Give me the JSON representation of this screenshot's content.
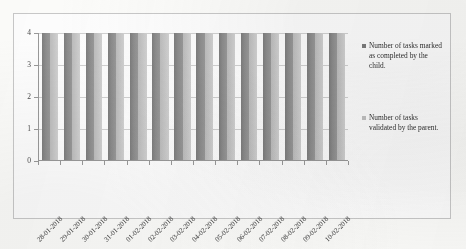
{
  "chart_data": {
    "type": "bar",
    "title": "",
    "subtitle": "",
    "xlabel": "",
    "ylabel": "",
    "ylim": [
      0,
      4
    ],
    "yticks": [
      "0",
      "1",
      "2",
      "3",
      "4"
    ],
    "grid": true,
    "legend_position": "right",
    "grouping": "grouped",
    "categories": [
      "28-01-2018",
      "29-01-2018",
      "30-01-2018",
      "31-01-2018",
      "01-02-2018",
      "02-02-2018",
      "03-02-2018",
      "04-02-2018",
      "05-02-2018",
      "06-02-2018",
      "07-02-2018",
      "08-02-2018",
      "09-02-2018",
      "10-02-2018"
    ],
    "series": [
      {
        "name": "Number of tasks marked as completed by the child.",
        "color": "#7d7d7d",
        "values": [
          4,
          4,
          4,
          4,
          4,
          4,
          4,
          4,
          4,
          4,
          4,
          4,
          4,
          4
        ]
      },
      {
        "name": "Number of tasks validated by the parent.",
        "color": "#c2c2c2",
        "values": [
          4,
          4,
          4,
          4,
          4,
          4,
          4,
          4,
          4,
          4,
          4,
          4,
          4,
          4
        ]
      }
    ]
  },
  "legend": {
    "entries": [
      {
        "label": "Number of tasks marked as completed by the child.",
        "swatch": "legend-swatch-series-1"
      },
      {
        "label": "Number of tasks validated by the parent.",
        "swatch": "legend-swatch-series-2"
      }
    ]
  }
}
